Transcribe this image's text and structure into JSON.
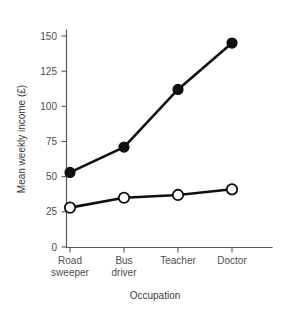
{
  "chart_data": {
    "type": "line",
    "title": "",
    "xlabel": "Occupation",
    "ylabel": "Mean weekly income (£)",
    "categories": [
      "Road sweeper",
      "Bus driver",
      "Teacher",
      "Doctor"
    ],
    "category_lines": [
      [
        "Road",
        "sweeper"
      ],
      [
        "Bus",
        "driver"
      ],
      [
        "Teacher",
        ""
      ],
      [
        "Doctor",
        ""
      ]
    ],
    "series": [
      {
        "name": "filled-circle-series",
        "marker": "filled-circle",
        "color": "#0f0f0f",
        "values": [
          53,
          71,
          112,
          145
        ]
      },
      {
        "name": "open-circle-series",
        "marker": "open-circle",
        "color": "#0f0f0f",
        "values": [
          28,
          35,
          37,
          41
        ]
      }
    ],
    "ylim": [
      0,
      157
    ],
    "yticks": [
      0,
      25,
      50,
      75,
      100,
      125,
      150
    ],
    "ytick_labels": [
      "0",
      "25",
      "50",
      "75",
      "100",
      "125",
      "150"
    ],
    "grid": false,
    "legend": "none"
  },
  "axes": {
    "y_title": "Mean weekly income (£)",
    "x_title": "Occupation",
    "y_labels": {
      "t0": "0",
      "t25": "25",
      "t50": "50",
      "t75": "75",
      "t100": "100",
      "t125": "125",
      "t150": "150"
    },
    "x_labels": {
      "c0_line1": "Road",
      "c0_line2": "sweeper",
      "c1_line1": "Bus",
      "c1_line2": "driver",
      "c2_line1": "Teacher",
      "c2_line2": "",
      "c3_line1": "Doctor",
      "c3_line2": ""
    }
  },
  "colors": {
    "axis": "#58595b",
    "text": "#4d4d4f",
    "series": "#0f0f0f",
    "background": "#ffffff"
  }
}
